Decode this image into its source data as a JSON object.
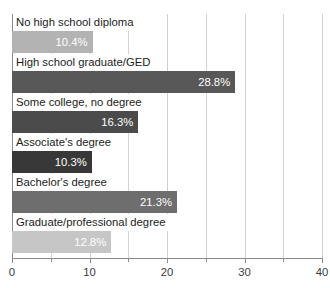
{
  "chart_data": {
    "type": "bar",
    "orientation": "horizontal",
    "title": "",
    "subtitle": "",
    "xlabel": "",
    "ylabel": "",
    "xlim": [
      0,
      40
    ],
    "grid": true,
    "legend": null,
    "value_suffix": "%",
    "x_ticks": [
      {
        "value": 0,
        "label": "0",
        "major": true
      },
      {
        "value": 5,
        "label": "",
        "major": false
      },
      {
        "value": 10,
        "label": "10",
        "major": true
      },
      {
        "value": 15,
        "label": "",
        "major": false
      },
      {
        "value": 20,
        "label": "20",
        "major": true
      },
      {
        "value": 25,
        "label": "",
        "major": false
      },
      {
        "value": 30,
        "label": "30",
        "major": true
      },
      {
        "value": 35,
        "label": "",
        "major": false
      },
      {
        "value": 40,
        "label": "40",
        "major": true
      }
    ],
    "categories": [
      "No high school diploma",
      "High school graduate/GED",
      "Some college, no degree",
      "Associate's degree",
      "Bachelor's degree",
      "Graduate/professional degree"
    ],
    "values": [
      10.4,
      28.8,
      16.3,
      10.3,
      21.3,
      12.8
    ],
    "value_labels": [
      "10.4%",
      "28.8%",
      "16.3%",
      "10.3%",
      "21.3%",
      "12.8%"
    ],
    "bar_colors": [
      "#b3b3b3",
      "#585858",
      "#4b4b4b",
      "#383838",
      "#6e6e6e",
      "#c6c6c6"
    ]
  },
  "axis_style": {
    "gridline_color": "#d2d2d2",
    "axis_color": "#8a8a8a",
    "tick_label_color": "#3a3a3a",
    "category_label_color": "#1c1c1c",
    "value_label_color": "#ffffff",
    "background": "#ffffff"
  }
}
